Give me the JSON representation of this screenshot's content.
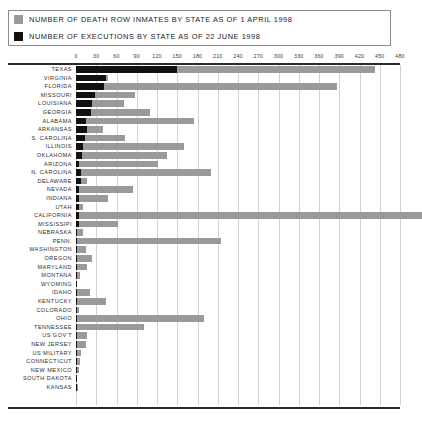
{
  "legend": {
    "items": [
      {
        "label": "Number of Death Row inmates by State as of 1 April 1998",
        "color": "#9a9a9a",
        "swatch_name": "inmates-swatch"
      },
      {
        "label": "Number of Executions by State as of 22 June 1998",
        "color": "#111111",
        "swatch_name": "executions-swatch"
      }
    ]
  },
  "chart_data": {
    "type": "bar",
    "orientation": "horizontal",
    "title": "",
    "xlabel": "",
    "ylabel": "",
    "xlim": [
      0,
      480
    ],
    "xticks": [
      0,
      30,
      60,
      90,
      120,
      150,
      180,
      210,
      240,
      270,
      300,
      330,
      360,
      390,
      420,
      450,
      480
    ],
    "grid": true,
    "legend_position": "above-plot",
    "categories": [
      "Texas",
      "Virginia",
      "Florida",
      "Missouri",
      "Louisiana",
      "Georgia",
      "Alabama",
      "Arkansas",
      "S. Carolina",
      "Illinois",
      "Oklahoma",
      "Arizona",
      "N. Carolina",
      "Delaware",
      "Nevada",
      "Indiana",
      "Utah",
      "California",
      "Mississipi",
      "Nebraska",
      "Penn.",
      "Washington",
      "Oregon",
      "Maryland",
      "Montana",
      "Wyoming",
      "Idaho",
      "Kentucky",
      "Colorado",
      "Ohio",
      "Tennessee",
      "US Gov't",
      "New Jersey",
      "US Military",
      "Connecticut",
      "New Mexico",
      "South Dakota",
      "Kansas"
    ],
    "series": [
      {
        "name": "Number of Death Row inmates by State as of 1 April 1998",
        "color": "#9a9a9a",
        "values": [
          443,
          48,
          387,
          87,
          71,
          110,
          175,
          40,
          72,
          160,
          135,
          121,
          200,
          17,
          85,
          48,
          11,
          512,
          62,
          10,
          215,
          15,
          23,
          17,
          6,
          2,
          20,
          44,
          4,
          190,
          100,
          17,
          15,
          8,
          6,
          4,
          2,
          3
        ]
      },
      {
        "name": "Number of Executions by State as of 22 June 1998",
        "color": "#111111",
        "values": [
          150,
          45,
          41,
          28,
          24,
          22,
          15,
          17,
          13,
          10,
          9,
          4,
          8,
          8,
          5,
          4,
          5,
          5,
          4,
          2,
          2,
          2,
          2,
          2,
          1,
          1,
          1,
          2,
          1,
          2,
          1,
          1,
          1,
          1,
          1,
          1,
          1,
          1
        ]
      }
    ]
  }
}
